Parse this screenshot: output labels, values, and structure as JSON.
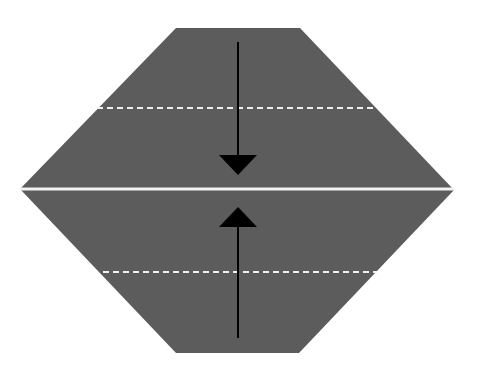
{
  "diagram": {
    "type": "origami-fold",
    "colors": {
      "background": "#ffffff",
      "paper": "#5c5c5c",
      "crease": "#f2f2f2",
      "dashed_fold": "#f0f0f0",
      "arrow": "#000000"
    },
    "shape": {
      "points": [
        [
          176,
          28
        ],
        [
          300,
          28
        ],
        [
          454,
          190
        ],
        [
          299,
          353
        ],
        [
          176,
          353
        ],
        [
          20,
          189
        ]
      ]
    },
    "center_crease": {
      "y": 189,
      "x1": 20,
      "x2": 454
    },
    "fold_lines": [
      {
        "name": "top-valley-fold",
        "y": 108,
        "x1": 97,
        "x2": 377
      },
      {
        "name": "bottom-valley-fold",
        "y": 272,
        "x1": 103,
        "x2": 377
      }
    ],
    "arrows": [
      {
        "name": "fold-down-arrow",
        "x": 238,
        "y_start": 42,
        "y_tip": 175,
        "head_base": 155
      },
      {
        "name": "fold-up-arrow",
        "x": 238,
        "y_start": 338,
        "y_tip": 207,
        "head_base": 227
      }
    ]
  }
}
